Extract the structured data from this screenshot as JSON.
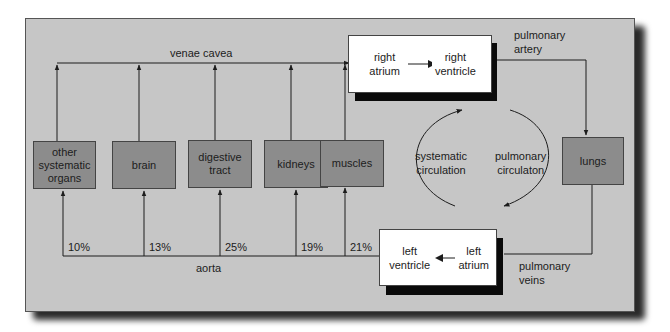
{
  "diagram": {
    "colors": {
      "panel": "#c6c6c6",
      "organ_box": "#8c8c8c",
      "heart_box": "#ffffff",
      "shadow": "#0a0a0a",
      "line": "#1c1c1c"
    },
    "vessels": {
      "venae_cavea": "venae cavea",
      "aorta": "aorta",
      "pulmonary_artery": [
        "pulmonary",
        "artery"
      ],
      "pulmonary_veins": [
        "pulmonary",
        "veins"
      ]
    },
    "organs": [
      {
        "id": "other",
        "lines": [
          "other",
          "systematic",
          "organs"
        ],
        "percent": "10%"
      },
      {
        "id": "brain",
        "lines": [
          "brain"
        ],
        "percent": "13%"
      },
      {
        "id": "digestive",
        "lines": [
          "digestive",
          "tract"
        ],
        "percent": "25%"
      },
      {
        "id": "kidneys",
        "lines": [
          "kidneys"
        ],
        "percent": "19%"
      },
      {
        "id": "muscles",
        "lines": [
          "muscles"
        ],
        "percent": "21%"
      }
    ],
    "lungs": "lungs",
    "right_heart": {
      "atrium": [
        "right",
        "atrium"
      ],
      "ventricle": [
        "right",
        "ventricle"
      ]
    },
    "left_heart": {
      "ventricle": [
        "left",
        "ventricle"
      ],
      "atrium": [
        "left",
        "atrium"
      ]
    },
    "circulations": {
      "systematic": [
        "systematic",
        "circulation"
      ],
      "pulmonary": [
        "pulmonary",
        "circulaton"
      ]
    }
  }
}
